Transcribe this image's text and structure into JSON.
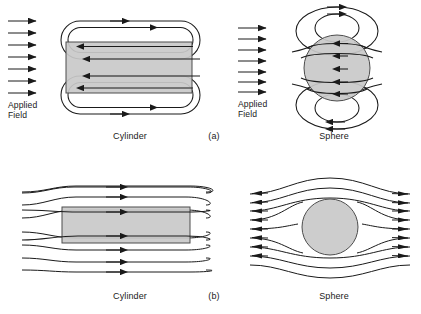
{
  "figure": {
    "background_color": "#ffffff",
    "stroke_color": "#1a1a1a",
    "body_fill_color": "#c9c9c9",
    "body_stroke_color": "#4d4d4d",
    "width": 421,
    "height": 314
  },
  "panels": [
    {
      "id": "panel-a-cylinder",
      "row_label": "(a)",
      "shape_label": "Cylinder",
      "field_label_line1": "Applied",
      "field_label_line2": "Field",
      "applied_arrow_count": 7,
      "description": "Magnetized cylinder with internal demagnetizing field loops"
    },
    {
      "id": "panel-a-sphere",
      "row_label": "(a)",
      "shape_label": "Sphere",
      "field_label_line1": "Applied",
      "field_label_line2": "Field",
      "applied_arrow_count": 7,
      "description": "Magnetized sphere with dipolar demagnetizing field loops"
    },
    {
      "id": "panel-b-cylinder",
      "row_label": "(b)",
      "shape_label": "Cylinder",
      "streamline_count": 8,
      "description": "Flux lines converging through a high permeability cylinder"
    },
    {
      "id": "panel-b-sphere",
      "row_label": "(b)",
      "shape_label": "Sphere",
      "streamline_count": 8,
      "description": "Flux lines converging through a high permeability sphere"
    }
  ],
  "labels": {
    "applied_field_line1": "Applied",
    "applied_field_line2": "Field",
    "cylinder": "Cylinder",
    "sphere": "Sphere",
    "row_a": "(a)",
    "row_b": "(b)"
  }
}
